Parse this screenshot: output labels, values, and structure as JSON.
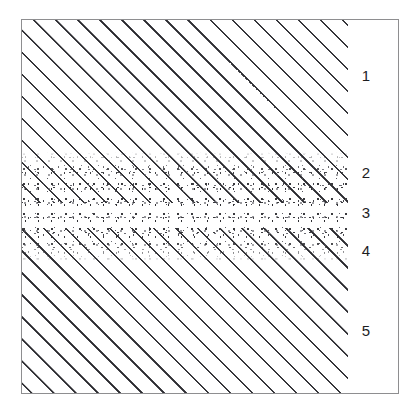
{
  "figure": {
    "background_color": "#ffffff",
    "frame_color": "#8e8e90",
    "hatch_color": "#262629",
    "stipple_color": "#3a3a3e",
    "hatch_angle_degrees": 45,
    "hatch_spacing_px": 22
  },
  "zones": [
    {
      "id": "zone-1",
      "label": "1",
      "pattern": "diagonal-hatch",
      "top_px": 20,
      "height_px": 132,
      "label_top_px": 48
    },
    {
      "id": "zone-2",
      "label": "2",
      "pattern": "diagonal-hatch-with-stipple",
      "top_px": 152,
      "height_px": 31,
      "label_top_px": 145
    },
    {
      "id": "zone-3",
      "label": "3",
      "pattern": "stipple",
      "top_px": 183,
      "height_px": 45,
      "label_top_px": 185
    },
    {
      "id": "zone-4",
      "label": "4",
      "pattern": "diagonal-hatch-with-stipple",
      "top_px": 228,
      "height_px": 34,
      "label_top_px": 223
    },
    {
      "id": "zone-5",
      "label": "5",
      "pattern": "diagonal-hatch",
      "top_px": 262,
      "height_px": 131,
      "label_top_px": 303
    }
  ]
}
